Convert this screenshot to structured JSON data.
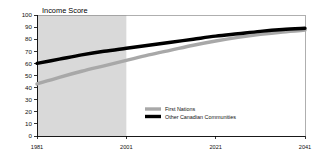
{
  "chart_data": {
    "type": "line",
    "title": "Income Score",
    "xlabel": "",
    "ylabel": "",
    "xlim": [
      1981,
      2041
    ],
    "ylim": [
      0,
      100
    ],
    "grid": false,
    "legend_position": "center",
    "x_ticks": [
      "1981",
      "2001",
      "2021",
      "2041"
    ],
    "x_tick_values": [
      1981,
      2001,
      2021,
      2041
    ],
    "y_ticks": [
      "0",
      "10",
      "20",
      "30",
      "40",
      "50",
      "60",
      "70",
      "80",
      "90",
      "100"
    ],
    "y_tick_values": [
      0,
      10,
      20,
      30,
      40,
      50,
      60,
      70,
      80,
      90,
      100
    ],
    "shaded_region": {
      "label": "historical-period",
      "x_start": 1981,
      "x_end": 2001,
      "color": "#d9d9d9"
    },
    "x": [
      1981,
      1986,
      1991,
      1996,
      2001,
      2006,
      2011,
      2016,
      2021,
      2026,
      2031,
      2036,
      2041
    ],
    "series": [
      {
        "name": "First Nations",
        "color": "#a8a8a8",
        "values": [
          43,
          48.5,
          53.5,
          58,
          62.5,
          67,
          71,
          75,
          78.5,
          81.5,
          84,
          86,
          87.5
        ]
      },
      {
        "name": "Other Canadian Communities",
        "color": "#000000",
        "values": [
          60,
          63.5,
          67,
          70,
          72.5,
          75,
          77.5,
          80,
          82.5,
          84.5,
          86.5,
          88,
          89
        ]
      }
    ]
  },
  "legend": {
    "entries": [
      {
        "label": "First Nations",
        "color": "#a8a8a8"
      },
      {
        "label": "Other Canadian Communities",
        "color": "#000000"
      }
    ]
  }
}
